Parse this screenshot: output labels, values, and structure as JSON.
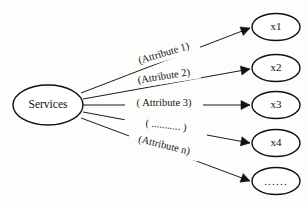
{
  "diagram": {
    "source_node": {
      "id": "services",
      "label": "Services",
      "shape": "ellipse",
      "cx": 48,
      "cy": 105,
      "rx": 35,
      "ry": 20
    },
    "target_nodes": [
      {
        "id": "x1",
        "label": "x1",
        "shape": "ellipse",
        "cx": 276,
        "cy": 27,
        "rx": 24,
        "ry": 13.5
      },
      {
        "id": "x2",
        "label": "x2",
        "shape": "ellipse",
        "cx": 276,
        "cy": 68,
        "rx": 24,
        "ry": 13.5
      },
      {
        "id": "x3",
        "label": "x3",
        "shape": "ellipse",
        "cx": 276,
        "cy": 105,
        "rx": 24,
        "ry": 13.5
      },
      {
        "id": "x4",
        "label": "x4",
        "shape": "ellipse",
        "cx": 276,
        "cy": 143,
        "rx": 24,
        "ry": 13.5
      },
      {
        "id": "xn",
        "label": "......",
        "shape": "ellipse",
        "cx": 276,
        "cy": 181,
        "rx": 24,
        "ry": 13.5
      }
    ],
    "edges": [
      {
        "id": "edge-1",
        "from": "services",
        "to": "x1",
        "label": "(Attribute 1)",
        "label_x": 164,
        "label_y": 54,
        "label_rotation": -17,
        "x1": 81,
        "y1": 93,
        "x2": 250,
        "y2": 28
      },
      {
        "id": "edge-2",
        "from": "services",
        "to": "x2",
        "label": "(Attribute 2)",
        "label_x": 164,
        "label_y": 77,
        "label_rotation": -9,
        "x1": 83,
        "y1": 99,
        "x2": 250,
        "y2": 69
      },
      {
        "id": "edge-3",
        "from": "services",
        "to": "x3",
        "label": "( Attribute 3)",
        "label_x": 164,
        "label_y": 104,
        "label_rotation": 0,
        "x1": 83,
        "y1": 105,
        "x2": 250,
        "y2": 105
      },
      {
        "id": "edge-4",
        "from": "services",
        "to": "x4",
        "label": "( ........... )",
        "label_x": 166,
        "label_y": 126,
        "label_rotation": 7,
        "x1": 83,
        "y1": 112,
        "x2": 250,
        "y2": 143
      },
      {
        "id": "edge-5",
        "from": "services",
        "to": "xn",
        "label": "(Attribute n)",
        "label_x": 164,
        "label_y": 146,
        "label_rotation": 14,
        "x1": 81,
        "y1": 118,
        "x2": 250,
        "y2": 181
      }
    ],
    "colors": {
      "stroke": "#111111",
      "text": "#141414",
      "background": "#fdfdfc",
      "node_fill": "#ffffff"
    }
  }
}
